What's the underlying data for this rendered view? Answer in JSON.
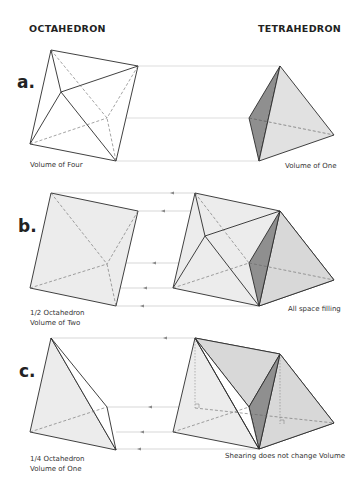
{
  "headings": {
    "left": "OCTAHEDRON",
    "right": "TETRAHEDRON"
  },
  "rows": [
    {
      "label": "a.",
      "left_caption": [
        "Volume of Four"
      ],
      "right_caption": [
        "Volume of One"
      ]
    },
    {
      "label": "b.",
      "left_caption": [
        "1/2 Octahedron",
        "Volume of Two"
      ],
      "right_caption": [
        "All space filling"
      ]
    },
    {
      "label": "c.",
      "left_caption": [
        "1/4 Octahedron",
        "Volume of One"
      ],
      "right_caption": [
        "Shearing does not change Volume"
      ]
    }
  ],
  "colors": {
    "edge": "#2b2b2b",
    "face_light": "#ececec",
    "face_mid": "#d9d9d9",
    "face_dark": "#8f8f8f",
    "guide": "#bdbdbd"
  }
}
